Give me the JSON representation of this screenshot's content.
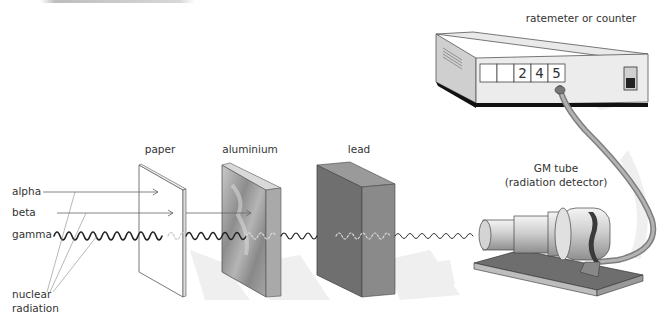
{
  "diagram": {
    "source_labels": {
      "alpha": "alpha",
      "beta": "beta",
      "gamma": "gamma",
      "group": "nuclear\nradiation",
      "group_line1": "nuclear",
      "group_line2": "radiation"
    },
    "absorbers": [
      {
        "id": "paper",
        "label": "paper",
        "stops": "alpha"
      },
      {
        "id": "aluminium",
        "label": "aluminium",
        "stops": "beta"
      },
      {
        "id": "lead",
        "label": "lead",
        "stops": "gamma (mostly)"
      }
    ],
    "detector": {
      "label_line1": "GM tube",
      "label_line2": "(radiation detector)"
    },
    "counter": {
      "label": "ratemeter or counter",
      "digits": [
        "",
        "",
        "2",
        "4",
        "5"
      ],
      "reading": "245"
    },
    "colors": {
      "line": "#555555",
      "wave": "#222222",
      "wave_attenuated": "#cccccc",
      "aluminium": "#9a9a9a",
      "lead_front": "#6f6f6f",
      "lead_side": "#8a8a8a",
      "counter_body": "#e4e4e4",
      "cable": "#9b9b9b",
      "shadow": "#ececec"
    }
  }
}
